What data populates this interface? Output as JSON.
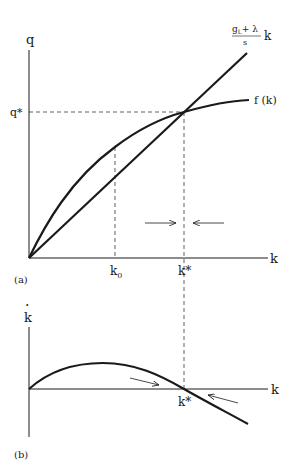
{
  "panel_a": {
    "tag": "(a)",
    "y_axis_label": "q",
    "x_axis_label": "k",
    "q_star_label": "q*",
    "k0_label": "k",
    "k0_sub": "0",
    "kstar_label": "k*",
    "line_label_num": "g",
    "line_label_sub": "L",
    "line_label_plus": "+ λ",
    "line_label_den": "s",
    "line_label_k": "k",
    "curve_label": "f (k)"
  },
  "panel_b": {
    "tag": "(b)",
    "y_axis_label": "k",
    "y_axis_dot": "·",
    "x_axis_label": "k",
    "kstar_label": "k*"
  },
  "colors": {
    "ink": "#1a1a1a",
    "background": "#ffffff"
  }
}
